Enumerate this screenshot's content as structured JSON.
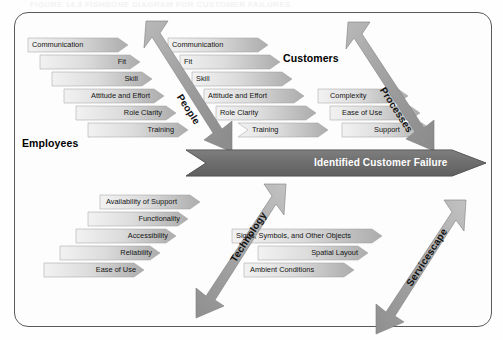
{
  "figure": {
    "caption": "FIGURE 14.3    FISHBONE DIAGRAM FOR CUSTOMER FAILURES"
  },
  "diagram": {
    "type": "fishbone",
    "effect": "Identified Customer Failure",
    "side_headings": [
      {
        "label": "Employees"
      },
      {
        "label": "Customers"
      }
    ],
    "branches": [
      {
        "name": "People",
        "label": "People",
        "group": "Employees",
        "position": "upper-left",
        "causes": [
          "Communication",
          "Fit",
          "Skill",
          "Attitude and Effort",
          "Role Clarity",
          "Training"
        ]
      },
      {
        "name": "Customers-People",
        "label": "People",
        "group": "Customers",
        "position": "upper-middle",
        "causes": [
          "Communication",
          "Fit",
          "Skill",
          "Attitude and Effort",
          "Role Clarity",
          "Training"
        ]
      },
      {
        "name": "Processes",
        "label": "Processes",
        "group": "Customers",
        "position": "upper-right",
        "causes": [
          "Complexity",
          "Ease of Use",
          "Support"
        ]
      },
      {
        "name": "Technology",
        "label": "Technology",
        "group": "Employees",
        "position": "lower-left",
        "causes": [
          "Availability of Support",
          "Functionality",
          "Accessibility",
          "Reliability",
          "Ease of Use"
        ]
      },
      {
        "name": "Servicescape",
        "label": "Servicescape",
        "group": "Customers",
        "position": "lower-right",
        "causes": [
          "Signs, Symbols, and Other Objects",
          "Spatial Layout",
          "Ambient Conditions"
        ]
      }
    ],
    "colors": {
      "spine": "#6e6e6e",
      "branch_arrow": "#9a9a9a",
      "cause_bar_light": "#efefef",
      "cause_bar_dark": "#b4b4b4",
      "frame": "#5a5a5a",
      "text": "#141414",
      "spine_text": "#ffffff"
    }
  }
}
